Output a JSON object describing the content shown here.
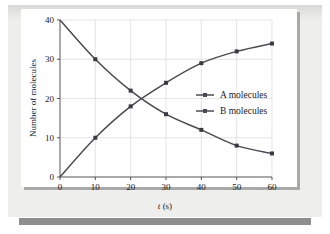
{
  "figure": {
    "background_color": "#eeeeec",
    "plot_background_color": "#ffffff",
    "shadow_color": "#a9a9a7",
    "rule_color": "#8e8e8e"
  },
  "chart_data": {
    "type": "line",
    "title": "",
    "xlabel": "t (s)",
    "xlabel_italic_part": "t",
    "xlabel_rest": " (s)",
    "ylabel": "Number of molecules",
    "xlim": [
      0,
      60
    ],
    "ylim": [
      0,
      40
    ],
    "xticks": [
      0,
      10,
      20,
      30,
      40,
      50,
      60
    ],
    "yticks": [
      0,
      10,
      20,
      30,
      40
    ],
    "xticklabels": [
      "0",
      "10",
      "20",
      "30",
      "40",
      "50",
      "60"
    ],
    "yticklabels": [
      "0",
      "10",
      "20",
      "30",
      "40"
    ],
    "grid": true,
    "grid_color": "#d9d9d9",
    "legend_position": "center-right",
    "x": [
      0,
      10,
      20,
      30,
      40,
      50,
      60
    ],
    "series": [
      {
        "name": "A molecules",
        "values": [
          40,
          30,
          22,
          16,
          12,
          8,
          6
        ],
        "color": "#4a4a52",
        "marker": "square"
      },
      {
        "name": "B molecules",
        "values": [
          0,
          10,
          18,
          24,
          29,
          32,
          34
        ],
        "color": "#4a4a52",
        "marker": "square"
      }
    ],
    "legend": [
      {
        "label": "A molecules",
        "color": "#4a4a52"
      },
      {
        "label": "B molecules",
        "color": "#4a4a52"
      }
    ]
  }
}
